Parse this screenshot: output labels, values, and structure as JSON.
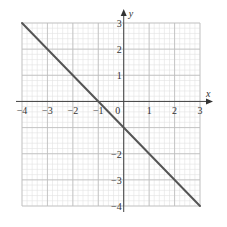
{
  "chart_data": {
    "type": "line",
    "title": "",
    "xlabel": "x",
    "ylabel": "y",
    "xlim": [
      -4,
      3
    ],
    "ylim": [
      -4,
      3
    ],
    "grid": true,
    "grid_minor_per_unit": 5,
    "x_ticks": [
      -4,
      -3,
      -2,
      -1,
      0,
      1,
      2,
      3
    ],
    "y_ticks": [
      -4,
      -3,
      -2,
      -1,
      1,
      2,
      3
    ],
    "x_tick_labels": [
      "−4",
      "−3",
      "−2",
      "−1",
      "0",
      "1",
      "2",
      "3"
    ],
    "y_tick_labels": [
      "−4",
      "−3",
      "−2",
      "",
      "1",
      "2",
      "3"
    ],
    "series": [
      {
        "name": "y = −x − 1",
        "x": [
          -4,
          3
        ],
        "y": [
          3,
          -4
        ],
        "color": "#555555"
      }
    ]
  },
  "colors": {
    "minor_grid": "#e3e3e3",
    "major_grid": "#bdbdbd",
    "axis": "#444444",
    "line": "#555555"
  },
  "labels": {
    "x_axis": "x",
    "y_axis": "y",
    "origin": "0"
  }
}
